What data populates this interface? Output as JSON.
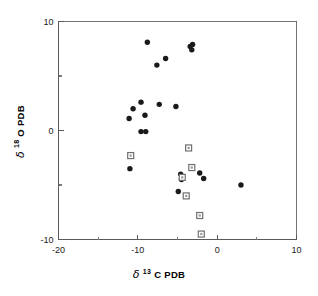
{
  "chart_data": {
    "type": "scatter",
    "title": "",
    "xlabel": "δ 13 C PDB",
    "ylabel": "δ 18 O PDB",
    "xlim": [
      -20,
      10
    ],
    "ylim": [
      -10,
      10
    ],
    "xticks": [
      -20,
      -10,
      0,
      10
    ],
    "yticks": [
      -10,
      0,
      10
    ],
    "xtick_labels": [
      "-20",
      "-10",
      "0",
      "10"
    ],
    "ytick_labels": [
      "-10",
      "0",
      "10"
    ],
    "xminor_ticks": [
      -15,
      -5,
      5
    ],
    "yminor_ticks": [
      -5,
      5
    ],
    "grid": false,
    "legend": "none",
    "series": [
      {
        "name": "filled-circles",
        "marker": "filled-circle",
        "color": "#1a1a1a",
        "points": [
          [
            -8.8,
            8.1
          ],
          [
            -6.5,
            6.6
          ],
          [
            -7.6,
            6.0
          ],
          [
            -3.4,
            7.7
          ],
          [
            -3.2,
            7.4
          ],
          [
            -3.1,
            7.9
          ],
          [
            -9.6,
            2.6
          ],
          [
            -7.3,
            2.4
          ],
          [
            -10.6,
            2.0
          ],
          [
            -5.2,
            2.2
          ],
          [
            -9.1,
            1.4
          ],
          [
            -11.1,
            1.1
          ],
          [
            -9.6,
            -0.1
          ],
          [
            -9.0,
            -0.1
          ],
          [
            -11.0,
            -3.5
          ],
          [
            -4.6,
            -4.0
          ],
          [
            -4.5,
            -4.5
          ],
          [
            -4.9,
            -5.6
          ],
          [
            -2.2,
            -3.9
          ],
          [
            -1.7,
            -4.4
          ],
          [
            3.0,
            -5.0
          ]
        ]
      },
      {
        "name": "open-squares",
        "marker": "open-square",
        "color": "#707070",
        "points": [
          [
            -10.9,
            -2.3
          ],
          [
            -3.6,
            -1.6
          ],
          [
            -3.2,
            -3.4
          ],
          [
            -4.4,
            -4.3
          ],
          [
            -3.9,
            -6.0
          ],
          [
            -2.2,
            -7.8
          ],
          [
            -2.0,
            -9.5
          ]
        ]
      }
    ]
  },
  "axes": {
    "x_axis_name": "delta-13-C-PDB-axis",
    "y_axis_name": "delta-18-O-PDB-axis"
  },
  "labels": {
    "x_delta": "δ",
    "x_superscript": "13",
    "x_main": "C PDB",
    "y_delta": "δ",
    "y_superscript": "18",
    "y_main": "O PDB"
  }
}
